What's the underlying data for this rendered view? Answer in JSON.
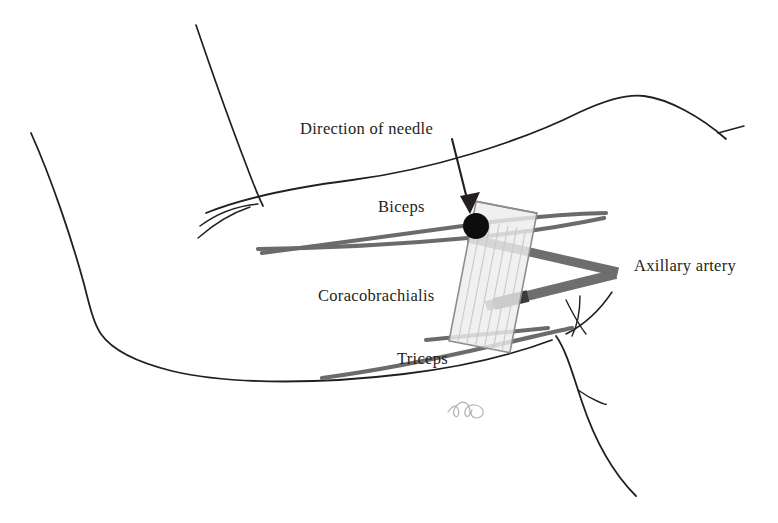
{
  "figure": {
    "background_color": "#ffffff",
    "width": 778,
    "height": 523
  },
  "labels": {
    "needle_direction": "Direction of needle",
    "biceps": "Biceps",
    "coracobrachialis": "Coracobrachialis",
    "triceps": "Triceps",
    "axillary_artery": "Axillary artery"
  },
  "signature": {
    "monogram": "bk"
  },
  "colors": {
    "outline": "#231f20",
    "muscle_line": "#6b6b6b",
    "artery": "#6e6e6e",
    "artery_dark": "#3a3a3a",
    "needle_target": "#0d0d0d",
    "probe_fill": "#ededed",
    "probe_stroke": "#8d8d8d",
    "probe_striation": "#c9c9c9",
    "signature": "#aaaaa8"
  },
  "elements": {
    "probe": {
      "name": "ultrasound-probe",
      "rotation_deg": 11,
      "x": 462,
      "y": 206,
      "width": 62,
      "height": 142,
      "striation_count": 6
    },
    "needle_target": {
      "name": "needle-target-point",
      "cx": 476,
      "cy": 226,
      "r": 13
    },
    "needle_arrow": {
      "name": "needle-direction-arrow",
      "x1": 452,
      "y1": 139,
      "x2": 470,
      "y2": 210
    }
  }
}
